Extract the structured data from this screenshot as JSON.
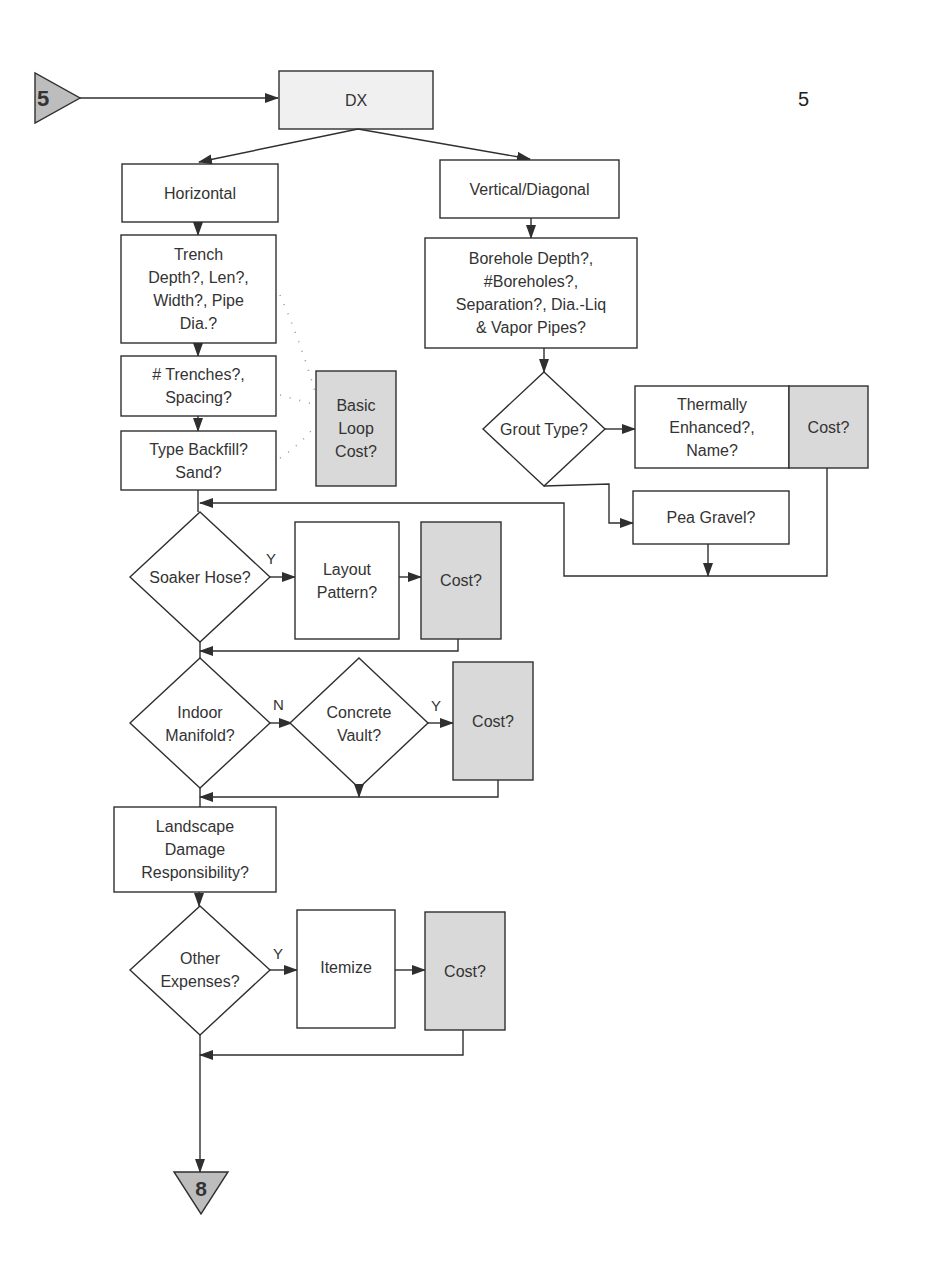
{
  "page": {
    "number": "5"
  },
  "connectors": {
    "start": {
      "label": "5",
      "fill": "#bdbdbd"
    },
    "end": {
      "label": "8",
      "fill": "#bdbdbd"
    }
  },
  "colors": {
    "stroke": "#2f2f2f",
    "cost_fill": "#d9d9d9",
    "dx_fill": "#f0f0f0",
    "box_fill": "#ffffff"
  },
  "nodes": {
    "dx": "DX",
    "horizontal": "Horizontal",
    "vertical": "Vertical/Diagonal",
    "trench": "Trench\nDepth?, Len?,\nWidth?, Pipe\nDia.?",
    "trenches": "# Trenches?,\nSpacing?",
    "backfill": "Type Backfill?\nSand?",
    "basic_loop_cost": "Basic\nLoop\nCost?",
    "borehole": "Borehole Depth?,\n#Boreholes?,\nSeparation?, Dia.-Liq\n& Vapor Pipes?",
    "grout_type": "Grout Type?",
    "thermally_enhanced": "Thermally\nEnhanced?,\nName?",
    "grout_cost": "Cost?",
    "pea_gravel": "Pea Gravel?",
    "soaker_hose": "Soaker Hose?",
    "layout_pattern": "Layout\nPattern?",
    "soaker_cost": "Cost?",
    "indoor_manifold": "Indoor\nManifold?",
    "concrete_vault": "Concrete\nVault?",
    "vault_cost": "Cost?",
    "landscape": "Landscape\nDamage\nResponsibility?",
    "other_expenses": "Other\nExpenses?",
    "itemize": "Itemize",
    "other_cost": "Cost?"
  },
  "edge_labels": {
    "soaker_yes": "Y",
    "manifold_no": "N",
    "vault_yes": "Y",
    "other_yes": "Y"
  }
}
